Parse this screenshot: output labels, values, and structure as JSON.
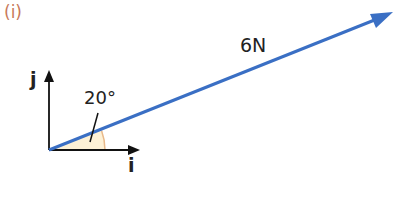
{
  "figure": {
    "part_label": "(i)",
    "vector": {
      "magnitude_label": "6N",
      "angle_label": "20°",
      "color": "#3a6fc4"
    },
    "axes": {
      "x_unit": "i",
      "y_unit": "j",
      "color": "#111111"
    },
    "angle_fill": "#fdf1d6",
    "angle_arc_color": "#e8b98a",
    "part_label_color": "#c8795a"
  }
}
